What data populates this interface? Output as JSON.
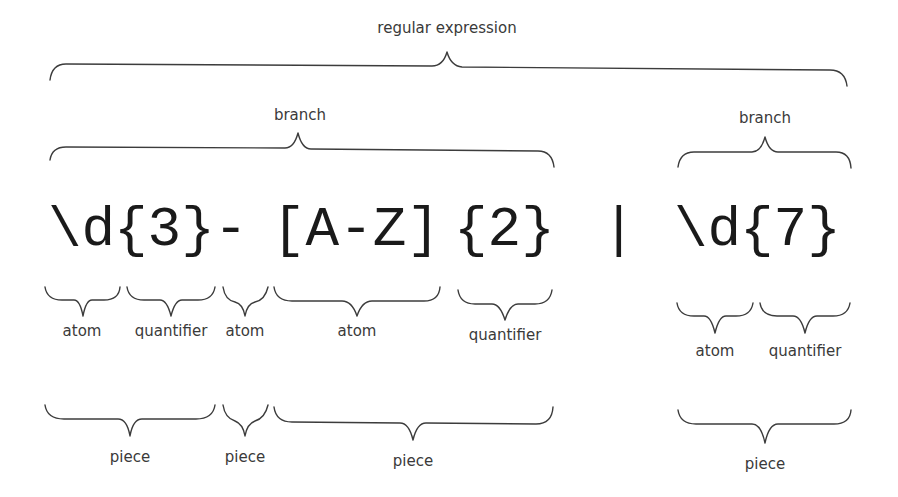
{
  "diagram": {
    "title_label": "regular expression",
    "expression": "\\d{3}-[A-Z]{2} | \\d{7}",
    "tokens": [
      {
        "text": "\\d",
        "x": 48
      },
      {
        "text": "{3}",
        "x": 114
      },
      {
        "text": "-",
        "x": 214
      },
      {
        "text": "[A-Z]",
        "x": 272
      },
      {
        "text": "{2}",
        "x": 454
      },
      {
        "text": "|",
        "x": 602
      },
      {
        "text": "\\d",
        "x": 674
      },
      {
        "text": "{7}",
        "x": 740
      }
    ],
    "branches": [
      {
        "label": "branch",
        "from": 45,
        "to": 554,
        "center": 298
      },
      {
        "label": "branch",
        "from": 678,
        "to": 851,
        "center": 765
      }
    ],
    "components": [
      {
        "label": "atom",
        "from": 45,
        "to": 120
      },
      {
        "label": "quantifier",
        "from": 127,
        "to": 215
      },
      {
        "label": "atom",
        "from": 223,
        "to": 268
      },
      {
        "label": "atom",
        "from": 274,
        "to": 440
      },
      {
        "label": "quantifier",
        "from": 458,
        "to": 552
      },
      {
        "label": "atom",
        "from": 677,
        "to": 753
      },
      {
        "label": "quantifier",
        "from": 760,
        "to": 850
      }
    ],
    "pieces": [
      {
        "label": "piece",
        "from": 45,
        "to": 215
      },
      {
        "label": "piece",
        "from": 223,
        "to": 268
      },
      {
        "label": "piece",
        "from": 274,
        "to": 553
      },
      {
        "label": "piece",
        "from": 678,
        "to": 851
      }
    ],
    "colors": {
      "line": "#3c3c3c",
      "code": "#1a1a1a",
      "label": "#3a3a3a",
      "background": "#ffffff"
    }
  }
}
